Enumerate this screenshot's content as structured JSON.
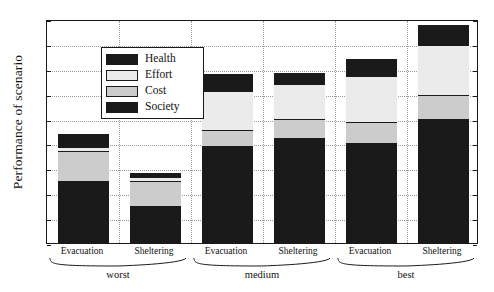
{
  "chart_data": {
    "type": "bar",
    "subtype": "stacked",
    "title": "",
    "xlabel": "",
    "ylabel": "Performance of scenario",
    "ylim": [
      0,
      0.9
    ],
    "yticks": [
      "0",
      "0.1",
      "0.2",
      "0.3",
      "0.4",
      "0.5",
      "0.6",
      "0.7",
      "0.8",
      "0.9"
    ],
    "ytick_values": [
      0,
      0.1,
      0.2,
      0.3,
      0.4,
      0.5,
      0.6,
      0.7,
      0.8,
      0.9
    ],
    "grid": true,
    "legend_position": "upper left",
    "categories": [
      "Evacuation",
      "Sheltering",
      "Evacuation",
      "Sheltering",
      "Evacuation",
      "Sheltering"
    ],
    "groups": [
      {
        "label": "worst",
        "members": [
          "Evacuation",
          "Sheltering"
        ]
      },
      {
        "label": "medium",
        "members": [
          "Evacuation",
          "Sheltering"
        ]
      },
      {
        "label": "best",
        "members": [
          "Evacuation",
          "Sheltering"
        ]
      }
    ],
    "series": [
      {
        "name": "Society",
        "color": "#1a1a1a",
        "values": [
          0.25,
          0.148,
          0.39,
          0.42,
          0.4,
          0.5
        ]
      },
      {
        "name": "Cost",
        "color": "#cccccc",
        "values": [
          0.12,
          0.1,
          0.065,
          0.078,
          0.088,
          0.095
        ]
      },
      {
        "name": "Effort",
        "color": "#ebebeb",
        "values": [
          0.015,
          0.017,
          0.157,
          0.142,
          0.182,
          0.2
        ]
      },
      {
        "name": "Health",
        "color": "#1a1a1a",
        "values": [
          0.052,
          0.017,
          0.068,
          0.045,
          0.07,
          0.08
        ]
      }
    ],
    "totals": [
      0.422,
      0.282,
      0.68,
      0.685,
      0.74,
      0.875
    ],
    "legend_entries": [
      {
        "label": "Health",
        "color": "#1a1a1a"
      },
      {
        "label": "Effort",
        "color": "#ebebeb"
      },
      {
        "label": "Cost",
        "color": "#cccccc"
      },
      {
        "label": "Society",
        "color": "#1a1a1a"
      }
    ]
  },
  "axis": {
    "y_title": "Performance of scenario"
  },
  "colors": {
    "health": "#1a1a1a",
    "effort": "#ebebeb",
    "cost": "#cccccc",
    "society": "#1a1a1a",
    "axis": "#1a1a1a",
    "grid": "#9a9a9a",
    "background": "#ffffff"
  }
}
